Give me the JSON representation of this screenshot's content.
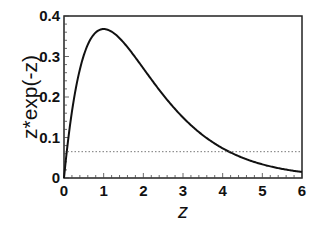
{
  "chart_data": {
    "type": "line",
    "title": "",
    "xlabel": "z",
    "ylabel": "z*exp(-z)",
    "xlim": [
      0,
      6
    ],
    "ylim": [
      0,
      0.4
    ],
    "xticks": [
      "0",
      "1",
      "2",
      "3",
      "4",
      "5",
      "6"
    ],
    "yticks": [
      "0",
      "0.1",
      "0.2",
      "0.3",
      "0.4"
    ],
    "grid": false,
    "legend": null,
    "series": [
      {
        "name": "z*exp(-z)",
        "style": "solid",
        "x": [
          0,
          0.25,
          0.5,
          0.75,
          1,
          1.5,
          2,
          2.5,
          3,
          3.5,
          4,
          4.5,
          5,
          5.5,
          6
        ],
        "values": [
          0,
          0.195,
          0.303,
          0.354,
          0.368,
          0.335,
          0.271,
          0.205,
          0.149,
          0.106,
          0.073,
          0.05,
          0.034,
          0.022,
          0.015
        ]
      },
      {
        "name": "threshold",
        "style": "dotted",
        "x": [
          0,
          6
        ],
        "values": [
          0.065,
          0.065
        ]
      }
    ]
  }
}
